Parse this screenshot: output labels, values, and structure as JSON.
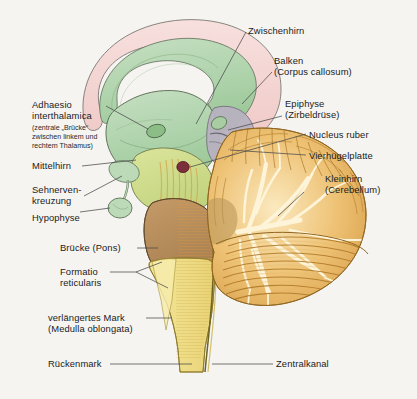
{
  "figure": {
    "background_color": "#f5f4f1",
    "leader_line_color": "#4a4a4a"
  },
  "colors": {
    "corpus_callosum": "#f3d5d3",
    "diencephalon_thalamus": "#b6d6b4",
    "thalamus_dark": "#9dc79a",
    "midbrain": "#cfdb8a",
    "nucleus_ruber": "#7c2f3a",
    "pons": "#b98f5e",
    "medulla": "#f0e18a",
    "spinal_cord": "#f3ecae",
    "cerebellum": "#e8b55c",
    "cerebellum_light": "#f7dfa8",
    "arbor_vitae": "#fdf3d8",
    "splenium_grey": "#b3adba",
    "pituitary": "#bcd9b8",
    "outline": "#3a3a32"
  },
  "labels": {
    "zwischenhirn": {
      "text": "Zwischenhirn",
      "side": "right"
    },
    "balken_line1": {
      "text": "Balken",
      "side": "right"
    },
    "balken_line2": {
      "text": "(Corpus callosum)",
      "side": "right"
    },
    "epiphyse_line1": {
      "text": "Epiphyse",
      "side": "right"
    },
    "epiphyse_line2": {
      "text": "(Zirbeldrüse)",
      "side": "right"
    },
    "nucleus_ruber": {
      "text": "Nucleus ruber",
      "side": "right"
    },
    "vierhuegelplatte": {
      "text": "Vierhügelplatte",
      "side": "right"
    },
    "kleinhirn_line1": {
      "text": "Kleinhirn",
      "side": "right"
    },
    "kleinhirn_line2": {
      "text": "(Cerebellum)",
      "side": "right"
    },
    "zentralkanal": {
      "text": "Zentralkanal",
      "side": "right"
    },
    "adhaesio_line1": {
      "text": "Adhaesio",
      "side": "left"
    },
    "adhaesio_line2": {
      "text": "interthalamica",
      "side": "left"
    },
    "adhaesio_sub1": {
      "text": "(zentrale „Brücke“",
      "side": "left"
    },
    "adhaesio_sub2": {
      "text": "zwischen linkem und",
      "side": "left"
    },
    "adhaesio_sub3": {
      "text": "rechtem Thalamus)",
      "side": "left"
    },
    "mittelhirn": {
      "text": "Mittelhirn",
      "side": "left"
    },
    "sehnerven_line1": {
      "text": "Sehnerven-",
      "side": "left"
    },
    "sehnerven_line2": {
      "text": "kreuzung",
      "side": "left"
    },
    "hypophyse": {
      "text": "Hypophyse",
      "side": "left"
    },
    "bruecke": {
      "text": "Brücke (Pons)",
      "side": "left"
    },
    "formatio_line1": {
      "text": "Formatio",
      "side": "left"
    },
    "formatio_line2": {
      "text": "reticularis",
      "side": "left"
    },
    "medulla_line1": {
      "text": "verlängertes Mark",
      "side": "left"
    },
    "medulla_line2": {
      "text": "(Medulla oblongata)",
      "side": "left"
    },
    "rueckenmark": {
      "text": "Rückenmark",
      "side": "left"
    }
  }
}
